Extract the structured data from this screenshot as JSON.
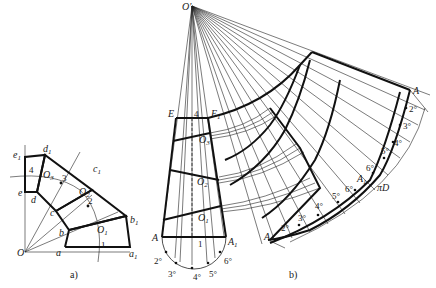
{
  "figure_a": {
    "caption": "a)",
    "labels": {
      "O": "O",
      "a": "a",
      "a1": "a",
      "a1_sub": "1",
      "b": "b",
      "b1": "b",
      "b1_sub": "1",
      "c": "c",
      "c1": "c",
      "c1_sub": "1",
      "d": "d",
      "d1": "d",
      "d1_sub": "1",
      "e": "e",
      "e1": "e",
      "e1_sub": "1",
      "O1": "O",
      "O1_sub": "1",
      "O2": "O",
      "O2_sub": "2",
      "O3": "O",
      "O3_sub": "3",
      "seg1": "1",
      "seg2": "2",
      "seg3": "3",
      "seg4": "4"
    }
  },
  "figure_b": {
    "caption": "b)",
    "labels": {
      "apex": "O'",
      "E": "E",
      "E1": "E",
      "E1_sub": "1",
      "seg4": "4",
      "O1": "O",
      "O1_sub": "1",
      "O2": "O",
      "O2_sub": "2",
      "O3": "O",
      "O3_sub": "3",
      "A": "A",
      "A1": "A",
      "A1_sub": "1",
      "seg1": "1",
      "semi_2": "2°",
      "semi_3": "3°",
      "semi_4": "4°",
      "semi_5": "5°",
      "semi_6": "6°",
      "dev_A_top": "A",
      "dev_2_top": "2°",
      "dev_3_top": "3°",
      "dev_4_top": "4°",
      "dev_5_top": "5°",
      "dev_6_top": "6°",
      "dev_A1": "A",
      "dev_A1_sub": "1",
      "dev_A_bot": "A",
      "dev_2_bot": "2°",
      "dev_3_bot": "3°",
      "dev_4_bot": "4°",
      "dev_5_bot": "5°",
      "dev_6_bot": "6°",
      "piD": "πD"
    }
  }
}
